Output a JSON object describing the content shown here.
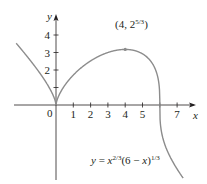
{
  "chart_data": {
    "type": "line",
    "title": "",
    "function": "y = x^(2/3) (6 - x)^(1/3)",
    "xlabel": "x",
    "ylabel": "y",
    "x_ticks": [
      1,
      2,
      3,
      4,
      5,
      6,
      7
    ],
    "x_tick_labels": [
      "1",
      "2",
      "3",
      "4",
      "5",
      "",
      "7"
    ],
    "y_ticks": [
      1,
      2,
      3,
      4
    ],
    "y_tick_labels": [
      "",
      "2",
      "3",
      "4"
    ],
    "origin_label": "0",
    "domain": [
      -2.3,
      7.35
    ],
    "grid": false,
    "annotations": [
      {
        "x": 4,
        "y": 3.175,
        "label_main": "(4, 2",
        "label_sup": "5/3",
        "label_end": ")"
      }
    ],
    "curve_label": {
      "y": "y",
      "eq": " = ",
      "x1": "x",
      "sup1": "2/3",
      "mid": "(6 − ",
      "x2": "x",
      "close": ")",
      "sup2": "1/3"
    },
    "colors": {
      "curve": "#8c8c8c",
      "axes": "#231f20"
    }
  }
}
